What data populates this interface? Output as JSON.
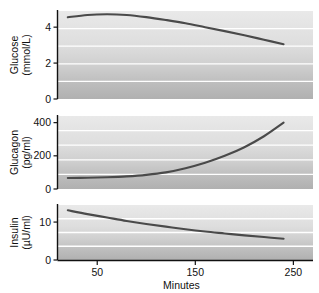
{
  "figure": {
    "xlabel": "Minutes",
    "x_ticks": [
      "50",
      "150",
      "250"
    ],
    "panels": [
      {
        "name": "glucose",
        "axis_label_line1": "Glucose",
        "axis_label_line2": "(mmol/L)",
        "y_ticks": [
          "4",
          "2",
          "0"
        ]
      },
      {
        "name": "glucagon",
        "axis_label_line1": "Glucagon",
        "axis_label_line2": "(pg/ml)",
        "y_ticks": [
          "400",
          "200",
          "0"
        ]
      },
      {
        "name": "insulin",
        "axis_label_line1": "Insulin",
        "axis_label_line2": "(µU/ml)",
        "y_ticks": [
          "10",
          "0"
        ]
      }
    ]
  },
  "colors": {
    "curve": "#4a4a4a",
    "gridline": "#ffffff",
    "axis": "#111111",
    "band_light": "#e6e6e6",
    "band_dark": "#b4b4b4",
    "background": "#ffffff"
  },
  "chart_data": [
    {
      "type": "line",
      "title": "",
      "xlabel": "Minutes",
      "ylabel": "Glucose (mmol/L)",
      "xlim": [
        10,
        270
      ],
      "ylim": [
        0,
        4.9
      ],
      "xticks": [
        50,
        150,
        250
      ],
      "yticks": [
        0,
        2,
        4
      ],
      "grid": true,
      "legend": "none",
      "series": [
        {
          "name": "Glucose",
          "x": [
            20,
            40,
            60,
            80,
            100,
            120,
            140,
            160,
            180,
            200,
            220,
            240
          ],
          "y": [
            4.55,
            4.68,
            4.72,
            4.68,
            4.56,
            4.4,
            4.22,
            4.0,
            3.78,
            3.55,
            3.3,
            3.05
          ]
        }
      ]
    },
    {
      "type": "line",
      "title": "",
      "xlabel": "Minutes",
      "ylabel": "Glucagon (pg/ml)",
      "xlim": [
        10,
        270
      ],
      "ylim": [
        0,
        440
      ],
      "xticks": [
        50,
        150,
        250
      ],
      "yticks": [
        0,
        200,
        400
      ],
      "grid": true,
      "legend": "none",
      "series": [
        {
          "name": "Glucagon",
          "x": [
            20,
            40,
            60,
            80,
            100,
            120,
            140,
            160,
            180,
            200,
            220,
            240
          ],
          "y": [
            66,
            68,
            71,
            76,
            85,
            100,
            125,
            158,
            200,
            252,
            318,
            400
          ]
        }
      ]
    },
    {
      "type": "line",
      "title": "",
      "xlabel": "Minutes",
      "ylabel": "Insulin (µU/ml)",
      "xlim": [
        10,
        270
      ],
      "ylim": [
        0,
        14.5
      ],
      "xticks": [
        50,
        150,
        250
      ],
      "yticks": [
        0,
        10
      ],
      "grid": true,
      "legend": "none",
      "series": [
        {
          "name": "Insulin",
          "x": [
            20,
            40,
            60,
            80,
            100,
            120,
            140,
            160,
            180,
            200,
            220,
            240
          ],
          "y": [
            13.1,
            12.1,
            11.2,
            10.3,
            9.5,
            8.8,
            8.1,
            7.5,
            7.0,
            6.5,
            6.05,
            5.6
          ]
        }
      ]
    }
  ]
}
